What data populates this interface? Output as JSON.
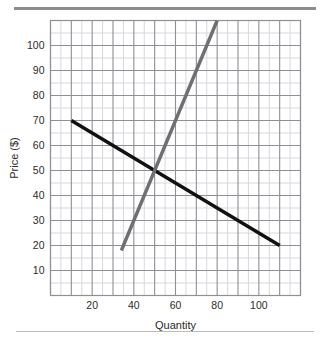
{
  "figure": {
    "background_color": "#ffffff",
    "top_rule_color": "#8c8c8e",
    "bottom_rule_color": "#bdbdbf"
  },
  "chart_data": {
    "type": "line",
    "title": "",
    "xlabel": "Quantity",
    "ylabel": "Price ($)",
    "xlim": [
      0,
      120
    ],
    "ylim": [
      0,
      110
    ],
    "xticks": [
      20,
      40,
      60,
      80,
      100
    ],
    "yticks": [
      10,
      20,
      30,
      40,
      50,
      60,
      70,
      80,
      90,
      100
    ],
    "xtick_labels": [
      "20",
      "40",
      "60",
      "80",
      "100"
    ],
    "ytick_labels": [
      "10",
      "20",
      "30",
      "40",
      "50",
      "60",
      "70",
      "80",
      "90",
      "100"
    ],
    "grid": true,
    "grid_minor_step_x": 5,
    "grid_minor_step_y": 5,
    "grid_major_step_x": 10,
    "grid_major_step_y": 10,
    "grid_minor_color": "#d8d8dc",
    "grid_major_color": "#8f8f96",
    "legend": "none",
    "series": [
      {
        "name": "demand",
        "color": "#111111",
        "width": 3.4,
        "x": [
          10,
          110
        ],
        "y": [
          70,
          20
        ],
        "points": [
          [
            10,
            70
          ],
          [
            110,
            20
          ]
        ]
      },
      {
        "name": "supply",
        "color": "#6f6f72",
        "width": 3.4,
        "x": [
          34,
          80
        ],
        "y": [
          18,
          110
        ],
        "points": [
          [
            34,
            18
          ],
          [
            80,
            110
          ]
        ]
      }
    ],
    "annotations": [],
    "equilibrium": {
      "quantity": 50,
      "price": 50
    }
  }
}
